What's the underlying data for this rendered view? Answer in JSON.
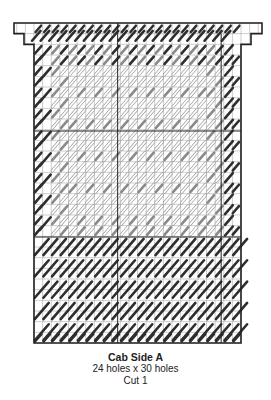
{
  "pattern": {
    "title": "Cab Side A",
    "size": "24 holes x 30 holes",
    "cut": "Cut 1",
    "cols": 24,
    "rows": 30
  },
  "colors": {
    "background": "#ffffff",
    "grid_line": "#9a9a9a",
    "outline": "#222222",
    "dark_stitch": "#2e2e2e",
    "medium_stitch": "#8a8a8a",
    "light_stitch_fill": "#ffffff",
    "light_stitch_stroke": "#9c9c9c"
  }
}
